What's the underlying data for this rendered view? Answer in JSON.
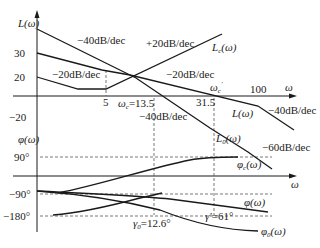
{
  "diagram": {
    "type": "bode_plot_compensation",
    "colors": {
      "line": "#1a1a1a",
      "dash": "#555555",
      "text": "#222222",
      "background": "#ffffff"
    },
    "magnitude_panel": {
      "y_axis_label": "L(ω)",
      "x_axis_label": "ω",
      "y_ticks": [
        "30",
        "20",
        "−20"
      ],
      "x_ticks": [
        "5",
        "100"
      ],
      "markers": {
        "wc": "ω",
        "wc_sub": "c",
        "wc_value": "=13.5",
        "wc_prime": "ω",
        "wc_prime_sub": "c",
        "wc_prime_sup": "′",
        "wc_prime_value": "31.5"
      },
      "slope_labels": {
        "s1": "−40dB/dec",
        "s2": "+20dB/dec",
        "s3": "−20dB/dec",
        "s4": "−20dB/dec",
        "s5": "−40dB/dec",
        "s6": "−40dB/dec",
        "s7": "−60dB/dec"
      },
      "curve_labels": {
        "Lc": "L",
        "Lc_sub": "c",
        "Lc_arg": "(ω)",
        "L": "L(ω)",
        "L0": "L",
        "L0_sub": "0",
        "L0_arg": "(ω)"
      }
    },
    "phase_panel": {
      "y_axis_label": "φ(ω)",
      "x_axis_label": "ω",
      "y_ticks": [
        "90°",
        "−90°",
        "−180°"
      ],
      "annotations": {
        "gamma0": "γ",
        "gamma0_sub": "0",
        "gamma0_value": "=12.6°",
        "gamma_prime": "γ′",
        "gamma_prime_value": "=61°"
      },
      "curve_labels": {
        "phic": "φ",
        "phic_sub": "c",
        "phic_arg": "(ω)",
        "phi": "φ(ω)",
        "phi0": "φ",
        "phi0_sub": "0",
        "phi0_arg": "(ω)"
      }
    }
  }
}
